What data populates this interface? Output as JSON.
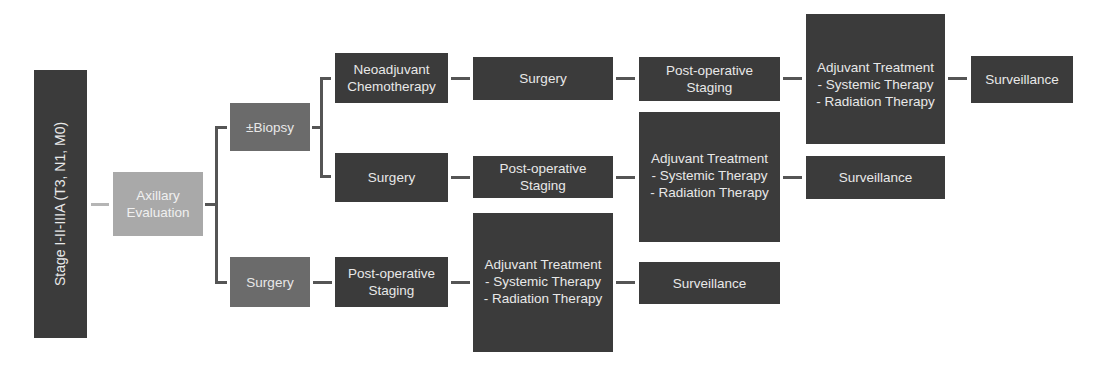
{
  "diagram": {
    "stage": "Stage I-II-IIIA (T3, N1, M0)",
    "axillary": "Axillary\nEvaluation",
    "branch_biopsy": {
      "label": "±Biopsy",
      "path_a": {
        "step1": "Neoadjuvant\nChemotherapy",
        "step2": "Surgery",
        "step3": "Post-operative\nStaging",
        "step4": "Adjuvant Treatment\n- Systemic Therapy\n- Radiation Therapy",
        "step5": "Surveillance"
      },
      "path_b": {
        "step1": "Surgery",
        "step2": "Post-operative\nStaging",
        "step3": "Adjuvant Treatment\n- Systemic Therapy\n- Radiation Therapy",
        "step4": "Surveillance"
      }
    },
    "branch_surgery": {
      "label": "Surgery",
      "step1": "Post-operative\nStaging",
      "step2": "Adjuvant Treatment\n- Systemic Therapy\n- Radiation Therapy",
      "step3": "Surveillance"
    },
    "colors": {
      "dark_box": "#3b3b3b",
      "mid_box": "#6b6b6b",
      "light_box": "#a9a9a9",
      "connector": "#555555",
      "text": "#e8e8e8"
    }
  }
}
